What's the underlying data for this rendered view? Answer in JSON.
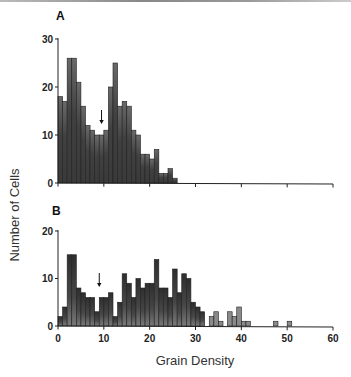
{
  "figure": {
    "ylabel": "Number of Cells",
    "xlabel": "Grain Density"
  },
  "chart_data": [
    {
      "type": "bar",
      "panel": "A",
      "title": "A",
      "xlabel": "",
      "ylabel": "Number of Cells",
      "bin_width": 1,
      "bin_starts": [
        0,
        1,
        2,
        3,
        4,
        5,
        6,
        7,
        8,
        9,
        10,
        11,
        12,
        13,
        14,
        15,
        16,
        17,
        18,
        19,
        20,
        21,
        22,
        23,
        24,
        25
      ],
      "values": [
        18,
        17,
        26,
        26,
        21,
        16,
        12,
        11,
        10,
        10,
        11,
        20,
        25,
        16,
        17,
        16,
        11,
        10,
        6,
        6,
        5,
        7,
        2,
        2,
        3,
        1
      ],
      "xlim": [
        0,
        60
      ],
      "ylim": [
        0,
        30
      ],
      "yticks": [
        0,
        10,
        20,
        30
      ],
      "xticks": [
        0,
        10,
        20,
        30,
        40,
        50,
        60
      ],
      "xtick_labels_shown": false,
      "arrow_x": 9.5,
      "colors": {
        "fill": "#3a3a3a",
        "fill_light": "#6e6e6e",
        "axis": "#222222"
      }
    },
    {
      "type": "bar",
      "panel": "B",
      "title": "B",
      "xlabel": "Grain Density",
      "ylabel": "Number of Cells",
      "bin_width": 1,
      "bin_starts": [
        0,
        1,
        2,
        3,
        4,
        5,
        6,
        7,
        8,
        9,
        10,
        11,
        12,
        13,
        14,
        15,
        16,
        17,
        18,
        19,
        20,
        21,
        22,
        23,
        24,
        25,
        26,
        27,
        28,
        29,
        30,
        31,
        32,
        33,
        34,
        35,
        36,
        37,
        38,
        39,
        40,
        41,
        42,
        43,
        44,
        45,
        46,
        47,
        48,
        49,
        50
      ],
      "values": [
        2,
        4,
        15,
        15,
        8,
        7,
        6,
        6,
        3,
        6,
        6,
        7,
        2,
        5,
        11,
        9,
        6,
        10,
        8,
        9,
        9,
        14,
        8,
        8,
        6,
        12,
        7,
        11,
        10,
        5,
        4,
        3,
        0,
        2,
        3,
        1,
        0,
        3,
        2,
        4,
        1,
        1,
        0,
        0,
        0,
        0,
        0,
        1,
        0,
        0,
        1
      ],
      "xlim": [
        0,
        60
      ],
      "ylim": [
        0,
        20
      ],
      "yticks": [
        0,
        10,
        20
      ],
      "xticks": [
        0,
        10,
        20,
        30,
        40,
        50,
        60
      ],
      "xtick_labels": [
        "0",
        "10",
        "20",
        "30",
        "40",
        "50",
        "60"
      ],
      "arrow_x": 9,
      "colors": {
        "fill": "#3a3a3a",
        "fill_light": "#7a7a7a",
        "axis": "#222222"
      }
    }
  ]
}
